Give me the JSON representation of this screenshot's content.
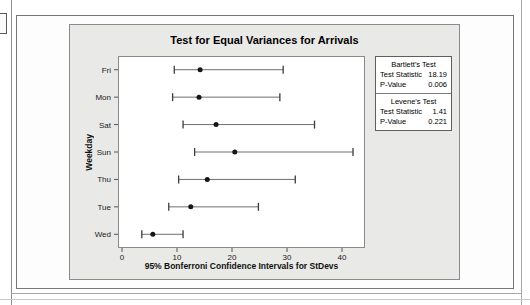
{
  "chart": {
    "title": "Test for Equal Variances for Arrivals",
    "xlabel": "95% Bonferroni Confidence Intervals for StDevs",
    "ylabel": "Weekday"
  },
  "stats": {
    "tests": [
      {
        "title": "Bartlett's Test",
        "rows": [
          {
            "label": "Test Statistic",
            "value": "18.19"
          },
          {
            "label": "P-Value",
            "value": "0.006"
          }
        ]
      },
      {
        "title": "Levene's Test",
        "rows": [
          {
            "label": "Test Statistic",
            "value": "1.41"
          },
          {
            "label": "P-Value",
            "value": "0.221"
          }
        ]
      }
    ]
  },
  "chart_data": {
    "type": "scatter",
    "subtype": "interval-plot",
    "title": "Test for Equal Variances for Arrivals",
    "xlabel": "95% Bonferroni Confidence Intervals for StDevs",
    "ylabel": "Weekday",
    "categories": [
      "Fri",
      "Mon",
      "Sat",
      "Sun",
      "Thu",
      "Tue",
      "Wed"
    ],
    "series": [
      {
        "name": "95% Bonferroni CI for StDev",
        "points": [
          {
            "category": "Fri",
            "lower": 9.5,
            "stdev": 14.2,
            "upper": 29.3
          },
          {
            "category": "Mon",
            "lower": 9.2,
            "stdev": 14.0,
            "upper": 28.7
          },
          {
            "category": "Sat",
            "lower": 11.1,
            "stdev": 17.1,
            "upper": 35.0
          },
          {
            "category": "Sun",
            "lower": 13.2,
            "stdev": 20.5,
            "upper": 42.0
          },
          {
            "category": "Thu",
            "lower": 10.3,
            "stdev": 15.5,
            "upper": 31.5
          },
          {
            "category": "Tue",
            "lower": 8.5,
            "stdev": 12.5,
            "upper": 24.8
          },
          {
            "category": "Wed",
            "lower": 3.6,
            "stdev": 5.6,
            "upper": 11.1
          }
        ]
      }
    ],
    "xticks": [
      0,
      10,
      20,
      30,
      40
    ],
    "xlim": [
      -0.73,
      44.18
    ],
    "grid": false,
    "legend_position": "none",
    "colors": {
      "panel_bg": "#e9e9e7",
      "plot_bg": "#ffffff",
      "interval_line": "#6f6f6f",
      "interval_cap": "#3c3c3c",
      "dot": "#161616",
      "frame": "#8a8a8a"
    }
  }
}
